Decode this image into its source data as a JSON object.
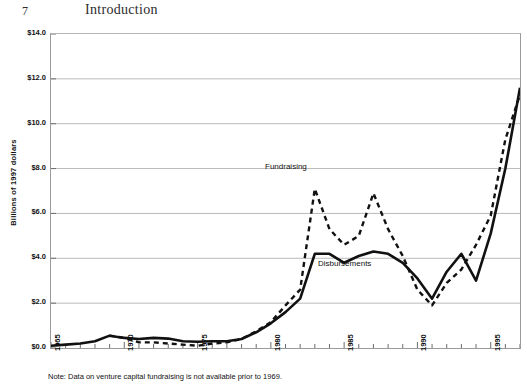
{
  "page": {
    "folio": "7",
    "running_head": "Introduction"
  },
  "figure": {
    "note": "Note: Data on venture capital fundraising is not available prior to 1969."
  },
  "chart_data": {
    "type": "line",
    "title": "",
    "xlabel": "",
    "ylabel": "Billions of 1997 dollars",
    "ylim": [
      0,
      14
    ],
    "ytick_values": [
      0,
      2,
      4,
      6,
      8,
      10,
      12,
      14
    ],
    "ytick_labels": [
      "$0.0",
      "$2.0",
      "$4.0",
      "$6.0",
      "$8.0",
      "$10.0",
      "$12.0",
      "$14.0"
    ],
    "xlim": [
      1965,
      1997
    ],
    "xtick_values": [
      1965,
      1966,
      1967,
      1968,
      1969,
      1970,
      1971,
      1972,
      1973,
      1974,
      1975,
      1976,
      1977,
      1978,
      1979,
      1980,
      1981,
      1982,
      1983,
      1984,
      1985,
      1986,
      1987,
      1988,
      1989,
      1990,
      1991,
      1992,
      1993,
      1994,
      1995,
      1996,
      1997
    ],
    "xtick_labeled": [
      1965,
      1970,
      1975,
      1980,
      1985,
      1990,
      1995
    ],
    "xtick_labels": [
      "1965",
      "1970",
      "1975",
      "1980",
      "1985",
      "1990",
      "1995"
    ],
    "grid": "horizontal",
    "legend_position": "inline-annotations",
    "annotations": [
      {
        "text": "Fundraising",
        "x": 1981,
        "y": 8.2
      },
      {
        "text": "Disbursements",
        "x": 1984,
        "y": 3.6
      }
    ],
    "x": [
      1965,
      1966,
      1967,
      1968,
      1969,
      1970,
      1971,
      1972,
      1973,
      1974,
      1975,
      1976,
      1977,
      1978,
      1979,
      1980,
      1981,
      1982,
      1983,
      1984,
      1985,
      1986,
      1987,
      1988,
      1989,
      1990,
      1991,
      1992,
      1993,
      1994,
      1995,
      1996,
      1997
    ],
    "series": [
      {
        "name": "Fundraising",
        "style": "dashed",
        "color": "#111111",
        "values": [
          null,
          null,
          null,
          null,
          0.55,
          0.45,
          0.25,
          0.25,
          0.2,
          0.15,
          0.1,
          0.2,
          0.25,
          0.4,
          0.75,
          1.15,
          1.9,
          2.6,
          7.1,
          5.3,
          4.6,
          5.0,
          6.9,
          5.3,
          4.1,
          2.6,
          1.9,
          2.9,
          3.5,
          4.6,
          5.9,
          9.3,
          11.3
        ]
      },
      {
        "name": "Disbursements",
        "style": "solid",
        "color": "#111111",
        "values": [
          0.1,
          0.15,
          0.2,
          0.3,
          0.55,
          0.45,
          0.4,
          0.45,
          0.42,
          0.3,
          0.28,
          0.3,
          0.3,
          0.4,
          0.7,
          1.1,
          1.6,
          2.2,
          4.2,
          4.2,
          3.8,
          4.1,
          4.3,
          4.2,
          3.8,
          3.1,
          2.2,
          3.4,
          4.2,
          3.0,
          5.1,
          8.0,
          11.6
        ]
      }
    ]
  }
}
